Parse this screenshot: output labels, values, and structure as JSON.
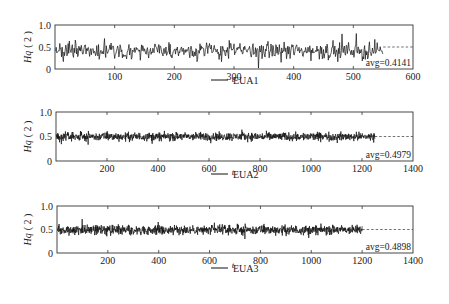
{
  "chart_data": [
    {
      "type": "line",
      "title": "",
      "xlabel": "t",
      "ylabel": "Hq (2)",
      "legend": [
        "EUA1"
      ],
      "xlim": [
        0,
        600
      ],
      "ylim": [
        0,
        1.0
      ],
      "xticks": [
        100,
        200,
        300,
        400,
        500,
        600
      ],
      "yticks": [
        0,
        0.5,
        1.0
      ],
      "ytick_labels": [
        "0",
        "0.5",
        "1.0"
      ],
      "series": [
        {
          "name": "EUA1",
          "n": 550,
          "mean": 0.4141,
          "amplitude": 0.14,
          "color": "#111111"
        }
      ],
      "avg_line": {
        "value": 0.5,
        "style": "dashed",
        "from_x": 550
      },
      "annotation": "avg=0.4141",
      "grid": false,
      "legend_position": "below"
    },
    {
      "type": "line",
      "title": "",
      "xlabel": "t",
      "ylabel": "Hq (2)",
      "legend": [
        "EUA2"
      ],
      "xlim": [
        0,
        1400
      ],
      "ylim": [
        0,
        1.0
      ],
      "xticks": [
        200,
        400,
        600,
        800,
        1000,
        1200,
        1400
      ],
      "yticks": [
        0,
        0.5,
        1.0
      ],
      "ytick_labels": [
        "0",
        "0.5",
        "1.0"
      ],
      "series": [
        {
          "name": "EUA2",
          "n": 1250,
          "mean": 0.4979,
          "amplitude": 0.06,
          "color": "#111111"
        }
      ],
      "avg_line": {
        "value": 0.5,
        "style": "dashed",
        "from_x": 1250
      },
      "annotation": "avg=0.4979",
      "grid": false,
      "legend_position": "below"
    },
    {
      "type": "line",
      "title": "",
      "xlabel": "t",
      "ylabel": "Hq (2)",
      "legend": [
        "EUA3"
      ],
      "xlim": [
        0,
        1400
      ],
      "ylim": [
        0,
        1.0
      ],
      "xticks": [
        200,
        400,
        600,
        800,
        1000,
        1200,
        1400
      ],
      "yticks": [
        0,
        0.5,
        1.0
      ],
      "ytick_labels": [
        "0",
        "0.5",
        "1.0"
      ],
      "series": [
        {
          "name": "EUA3",
          "n": 1200,
          "mean": 0.4898,
          "amplitude": 0.07,
          "color": "#111111"
        }
      ],
      "avg_line": {
        "value": 0.5,
        "style": "dashed",
        "from_x": 1200
      },
      "annotation": "avg=0.4898",
      "grid": false,
      "legend_position": "below"
    }
  ],
  "panels": [
    {
      "ylabel_main": "Hq",
      "ylabel_arg": "( 2 )",
      "xlabel": "t",
      "legend_label": "EUA1",
      "avg_label": "avg=0.4141"
    },
    {
      "ylabel_main": "Hq",
      "ylabel_arg": "( 2 )",
      "xlabel": "t",
      "legend_label": "EUA2",
      "avg_label": "avg=0.4979"
    },
    {
      "ylabel_main": "Hq",
      "ylabel_arg": "( 2 )",
      "xlabel": "t",
      "legend_label": "EUA3",
      "avg_label": "avg=0.4898"
    }
  ]
}
